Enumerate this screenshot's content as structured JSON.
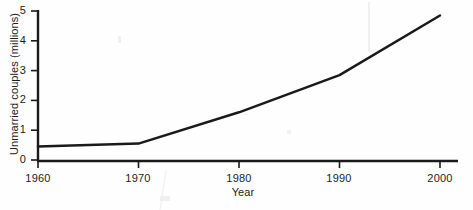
{
  "chart_data": {
    "type": "line",
    "title": "",
    "xlabel": "Year",
    "ylabel": "Unmarried couples (millions)",
    "x": [
      1960,
      1970,
      1980,
      1990,
      2000
    ],
    "values": [
      0.45,
      0.55,
      1.6,
      2.85,
      4.85
    ],
    "series": [
      {
        "name": "Unmarried couples",
        "values": [
          0.45,
          0.55,
          1.6,
          2.85,
          4.85
        ]
      }
    ],
    "xlim": [
      1960,
      2000
    ],
    "ylim": [
      0,
      5
    ],
    "x_ticks": [
      "1960",
      "1970",
      "1980",
      "1990",
      "2000"
    ],
    "y_ticks": [
      "0",
      "1",
      "2",
      "3",
      "4",
      "5"
    ],
    "grid": false,
    "legend": "none",
    "line_color": "#1a1a1a"
  },
  "axes": {
    "x_tick_labels": [
      "1960",
      "1970",
      "1980",
      "1990",
      "2000"
    ],
    "y_tick_labels": [
      "5",
      "4",
      "3",
      "2",
      "1",
      "0"
    ],
    "x_title": "Year",
    "y_title": "Unmarried couples (millions)"
  }
}
